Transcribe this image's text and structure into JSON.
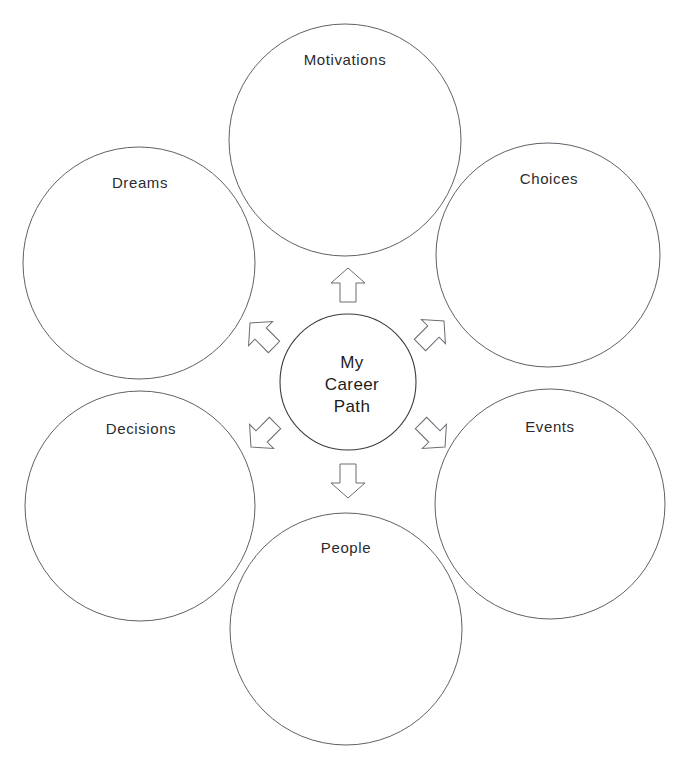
{
  "diagram": {
    "type": "radial-mind-map",
    "title": "My Career Path",
    "background_color": "#ffffff",
    "outline_color": "#5f6168",
    "text_color": "#2b2b2f",
    "center": {
      "id": "center-node",
      "lines": [
        "My",
        "Career",
        "Path"
      ],
      "line1": "My",
      "line2": "Career",
      "line3": "Path",
      "cx": 348,
      "cy": 382,
      "r": 68
    },
    "nodes": [
      {
        "id": "motivations",
        "label": "Motivations",
        "position": "top",
        "cx": 345,
        "cy": 140,
        "r": 116,
        "label_x": 345,
        "label_y": 65
      },
      {
        "id": "choices",
        "label": "Choices",
        "position": "top-right",
        "cx": 548,
        "cy": 255,
        "r": 112,
        "label_x": 549,
        "label_y": 184
      },
      {
        "id": "events",
        "label": "Events",
        "position": "bottom-right",
        "cx": 550,
        "cy": 504,
        "r": 115,
        "label_x": 550,
        "label_y": 432
      },
      {
        "id": "people",
        "label": "People",
        "position": "bottom",
        "cx": 346,
        "cy": 629,
        "r": 116,
        "label_x": 346,
        "label_y": 553
      },
      {
        "id": "decisions",
        "label": "Decisions",
        "position": "bottom-left",
        "cx": 140,
        "cy": 506,
        "r": 115,
        "label_x": 141,
        "label_y": 434
      },
      {
        "id": "dreams",
        "label": "Dreams",
        "position": "top-left",
        "cx": 139,
        "cy": 263,
        "r": 116,
        "label_x": 140,
        "label_y": 188
      }
    ],
    "arrows": [
      {
        "id": "arrow-up",
        "direction": "up",
        "points_to": "motivations",
        "cx": 348,
        "cy": 285,
        "angle": 0
      },
      {
        "id": "arrow-up-right",
        "direction": "up-right",
        "points_to": "choices",
        "cx": 432,
        "cy": 333,
        "angle": 45
      },
      {
        "id": "arrow-down-right",
        "direction": "down-right",
        "points_to": "events",
        "cx": 433,
        "cy": 435,
        "angle": 135
      },
      {
        "id": "arrow-down",
        "direction": "down",
        "points_to": "people",
        "cx": 348,
        "cy": 481,
        "angle": 180
      },
      {
        "id": "arrow-down-left",
        "direction": "down-left",
        "points_to": "decisions",
        "cx": 263,
        "cy": 435,
        "angle": 225
      },
      {
        "id": "arrow-up-left",
        "direction": "up-left",
        "points_to": "dreams",
        "cx": 262,
        "cy": 335,
        "angle": 315
      }
    ]
  }
}
